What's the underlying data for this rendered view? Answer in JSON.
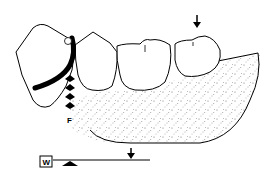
{
  "diagram": {
    "type": "dental-cross-section",
    "colors": {
      "line": "#000000",
      "background": "#ffffff",
      "stipple": "#555555"
    },
    "labels": {
      "force": "F",
      "legend_box": "W"
    },
    "elements": [
      "tipped-anterior-tooth",
      "clasp-arm",
      "premolar",
      "molar-1",
      "molar-2",
      "denture-base-stippled",
      "force-arrows",
      "occlusal-arrow"
    ],
    "legend": {
      "label": "W"
    }
  }
}
